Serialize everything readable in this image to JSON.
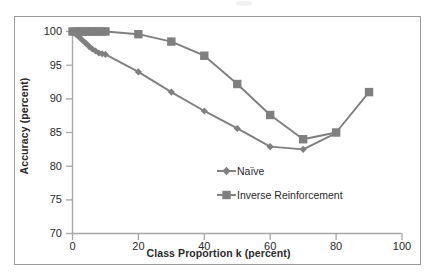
{
  "figure": {
    "background_color": "#ffffff",
    "border_color": "#9a9a9a",
    "series_color": "#7f7f7f",
    "text_color": "#2a2a2a"
  },
  "chart_data": {
    "type": "line",
    "title": "",
    "xlabel": "Class Proportion k (percent)",
    "ylabel": "Accuracy (percent)",
    "xlim": [
      0,
      100
    ],
    "ylim": [
      70,
      100
    ],
    "xticks": [
      0,
      20,
      40,
      60,
      80,
      100
    ],
    "yticks": [
      70,
      75,
      80,
      85,
      90,
      95,
      100
    ],
    "grid": false,
    "legend_position": "inside-lower-center",
    "series": [
      {
        "name": "Naïve",
        "marker": "diamond",
        "color": "#7f7f7f",
        "x": [
          0,
          1,
          2,
          3,
          4,
          5,
          6,
          7,
          8,
          9,
          10,
          20,
          30,
          40,
          50,
          60,
          70,
          80
        ],
        "values": [
          100,
          99.6,
          99.2,
          98.7,
          98.3,
          97.8,
          97.4,
          97.1,
          96.8,
          96.7,
          96.6,
          94.0,
          91.0,
          88.2,
          85.6,
          82.9,
          82.5,
          84.9
        ]
      },
      {
        "name": "Inverse Reinforcement",
        "marker": "square",
        "color": "#7f7f7f",
        "x": [
          0,
          1,
          2,
          3,
          4,
          5,
          6,
          7,
          8,
          9,
          10,
          20,
          30,
          40,
          50,
          60,
          70,
          80,
          90
        ],
        "values": [
          100,
          100,
          100,
          100,
          100,
          100,
          100,
          100,
          100,
          100,
          100,
          99.6,
          98.5,
          96.4,
          92.2,
          87.6,
          84.0,
          85.0,
          91.0
        ]
      }
    ]
  },
  "axes": {
    "y_tick_labels": [
      "100",
      "95",
      "90",
      "85",
      "80",
      "75",
      "70"
    ],
    "x_tick_labels": [
      "0",
      "20",
      "40",
      "60",
      "80",
      "100"
    ],
    "y_title": "Accuracy (percent)",
    "x_title": "Class Proportion k (percent)"
  },
  "legend": {
    "entries": [
      {
        "label": "Naïve",
        "marker": "diamond"
      },
      {
        "label": "Inverse Reinforcement",
        "marker": "square"
      }
    ]
  }
}
